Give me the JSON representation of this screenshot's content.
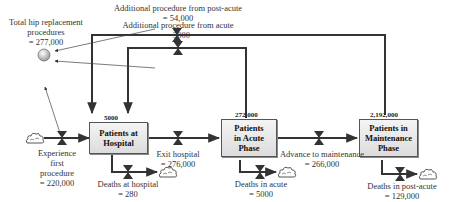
{
  "diagram": {
    "type": "stock-and-flow",
    "stocks": [
      {
        "id": "hospital",
        "label": "Patients at Hospital",
        "lines": [
          "Patients at",
          "Hospital"
        ],
        "value": "5000"
      },
      {
        "id": "acute",
        "label": "Patients in Acute Phase",
        "lines": [
          "Patients",
          "in Acute",
          "Phase"
        ],
        "value": "272,000"
      },
      {
        "id": "maintenance",
        "label": "Patients in Maintenance Phase",
        "lines": [
          "Patients in",
          "Maintenance",
          "Phase"
        ],
        "value": "2,192,000"
      }
    ],
    "auxiliary": {
      "label_lines": [
        "Total hip replacement",
        "procedures",
        "= 277,000"
      ]
    },
    "flows": [
      {
        "id": "experience_first",
        "lines": [
          "Experience",
          "first",
          "procedure",
          "= 220,000"
        ],
        "from": "source",
        "to": "hospital"
      },
      {
        "id": "exit_hospital",
        "lines": [
          "Exit hospital",
          "= 276,000"
        ],
        "from": "hospital",
        "to": "acute"
      },
      {
        "id": "advance_maintenance",
        "lines": [
          "Advance to maintenance",
          "= 266,000"
        ],
        "from": "acute",
        "to": "maintenance"
      },
      {
        "id": "deaths_hospital",
        "lines": [
          "Deaths at hospital",
          "= 280"
        ],
        "from": "hospital",
        "to": "sink"
      },
      {
        "id": "deaths_acute",
        "lines": [
          "Deaths in acute",
          "= 5000"
        ],
        "from": "acute",
        "to": "sink"
      },
      {
        "id": "deaths_postacute",
        "lines": [
          "Deaths in post-acute",
          "= 129,000"
        ],
        "from": "maintenance",
        "to": "sink"
      },
      {
        "id": "additional_acute",
        "lines": [
          "Additional procedure from acute",
          "= 3000"
        ],
        "from": "acute",
        "to": "hospital"
      },
      {
        "id": "additional_postacute",
        "lines": [
          "Additional procedure from post-acute",
          "= 54,000"
        ],
        "from": "maintenance",
        "to": "hospital"
      }
    ],
    "colors": {
      "line": "#333333",
      "stock_fill": "#e6e6e6",
      "stock_border": "#555555",
      "valve": "#333333"
    }
  }
}
